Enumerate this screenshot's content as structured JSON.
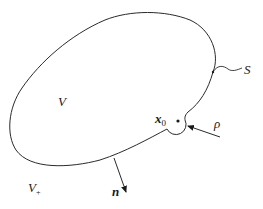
{
  "diagram": {
    "type": "boundary-region-sketch",
    "colors": {
      "stroke": "#2a2a2a",
      "text": "#1a1a1a",
      "background": "#ffffff"
    },
    "labels": {
      "interior": "V",
      "exterior_base": "V",
      "exterior_sub": "+",
      "surface": "S",
      "point_base": "x",
      "point_sub": "0",
      "radius": "ρ",
      "normal": "n"
    },
    "elements": [
      {
        "id": "boundary-curve",
        "label": "S",
        "desc": "closed smooth surface"
      },
      {
        "id": "interior-region",
        "label": "V"
      },
      {
        "id": "exterior-region",
        "label": "V+"
      },
      {
        "id": "singular-point",
        "label": "x0"
      },
      {
        "id": "exclusion-radius",
        "label": "ρ"
      },
      {
        "id": "outward-normal",
        "label": "n"
      }
    ]
  }
}
